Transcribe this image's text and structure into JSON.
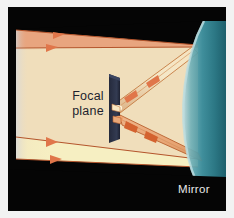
{
  "figure": {
    "kind": "optics-ray-diagram",
    "title_visible": false,
    "border_color": "#f2f2f2",
    "background_color": "#050505"
  },
  "labels": {
    "focal_plane": "Focal\nplane",
    "focal_plane_line1": "Focal",
    "focal_plane_line2": "plane",
    "mirror": "Mirror"
  },
  "colors": {
    "backdrop_black": "#050505",
    "beam_upper_salmon": "#e8a57f",
    "beam_cone_cream": "#f0debb",
    "beam_lower_pale_yellow": "#f6efc2",
    "mirror_teal_dark": "#2f7f8c",
    "mirror_teal_mid": "#4e9fa8",
    "mirror_teal_light": "#9fcbd0",
    "ray_line_orange": "#c4693a",
    "arrow_orange": "#e07a43",
    "reflected_beam_tan": "#e9c79a",
    "focal_plane_slab": "#2b3044",
    "label_dark": "#1d1f2e",
    "label_light": "#e9e9ea"
  },
  "elements": {
    "mirror_description": "concave curved mirror at right edge, teal",
    "focal_plane_description": "dark tilted slab standing vertically left of centre",
    "incoming_beam_description": "parallel light rays entering from the left",
    "reflected_beam_description": "two converging reflected ray bundles meeting at the focal plane"
  },
  "rays": {
    "incoming": [
      {
        "name": "top-edge-ray",
        "y_left": 30,
        "y_right": 38,
        "arrow_x": 58
      },
      {
        "name": "upper-ray",
        "y_left": 48,
        "y_right": 56,
        "arrow_x": 50
      },
      {
        "name": "lower-ray",
        "y_left": 138,
        "y_right": 128,
        "arrow_x": 48
      },
      {
        "name": "bottom-edge-ray",
        "y_left": 158,
        "y_right": 148,
        "arrow_x": 52
      }
    ],
    "reflected": [
      {
        "name": "upper-reflected-bundle",
        "from": "mirror-top",
        "to": "focal-point",
        "arrow_count": 2
      },
      {
        "name": "lower-reflected-bundle",
        "from": "mirror-bottom",
        "to": "focal-point",
        "arrow_count": 2
      }
    ]
  }
}
